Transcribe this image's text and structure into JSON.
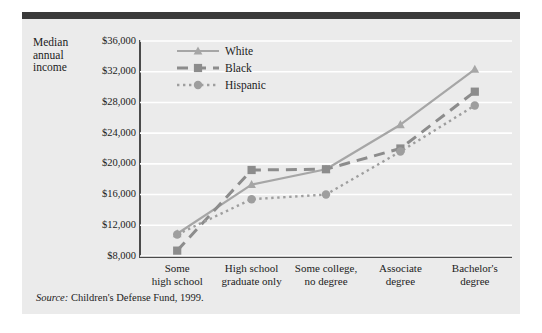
{
  "chart_data": {
    "type": "line",
    "title": "",
    "subtitle": "",
    "xlabel": "",
    "ylabel": "Median annual income",
    "ylabel_lines": [
      "Median",
      "annual",
      "income"
    ],
    "categories": [
      "Some\nhigh school",
      "High school\ngraduate only",
      "Some college,\nno degree",
      "Associate\ndegree",
      "Bachelor's\ndegree"
    ],
    "category_lines": [
      [
        "Some",
        "high school"
      ],
      [
        "High school",
        "graduate only"
      ],
      [
        "Some college,",
        "no degree"
      ],
      [
        "Associate",
        "degree"
      ],
      [
        "Bachelor's",
        "degree"
      ]
    ],
    "series": [
      {
        "name": "White",
        "marker": "triangle",
        "linestyle": "solid",
        "color": "#a6a6a6",
        "values": [
          10900,
          17300,
          19300,
          25100,
          32300
        ]
      },
      {
        "name": "Black",
        "marker": "square",
        "linestyle": "dashed",
        "color": "#8c8c8c",
        "values": [
          8700,
          19200,
          19300,
          22000,
          29400
        ]
      },
      {
        "name": "Hispanic",
        "marker": "circle",
        "linestyle": "dotted",
        "color": "#9e9e9e",
        "values": [
          10800,
          15400,
          16000,
          21600,
          27600
        ]
      }
    ],
    "ylim": [
      8000,
      36000
    ],
    "ytick_values": [
      8000,
      12000,
      16000,
      20000,
      24000,
      28000,
      32000,
      36000
    ],
    "ytick_labels": [
      "$8,000",
      "$12,000",
      "$16,000",
      "$20,000",
      "$24,000",
      "$28,000",
      "$32,000",
      "$36,000"
    ],
    "grid": true,
    "grid_color": "#ffffff",
    "legend_position": "upper-left-inside",
    "panel_color": "#ebebeb",
    "axis_color": "#4a4a4a"
  },
  "legend": {
    "entries": [
      {
        "label": "White"
      },
      {
        "label": "Black"
      },
      {
        "label": "Hispanic"
      }
    ]
  },
  "source": {
    "prefix": "Source:",
    "text": "Children's Defense Fund, 1999."
  }
}
